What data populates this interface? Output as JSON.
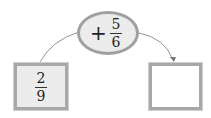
{
  "diagram": {
    "start": {
      "numerator": "2",
      "denominator": "9"
    },
    "operation": {
      "operator": "+",
      "numerator": "5",
      "denominator": "6"
    },
    "result": {
      "value": ""
    },
    "colors": {
      "box_border": "#a8a8a8",
      "box_fill": "#ececec",
      "arrow": "#777777"
    }
  }
}
